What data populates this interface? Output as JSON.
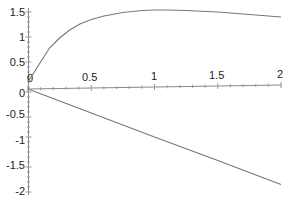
{
  "chart_data": [
    {
      "type": "line",
      "title": "",
      "xlabel": "",
      "ylabel": "",
      "xlim": [
        0,
        2
      ],
      "ylim": [
        0,
        1.6
      ],
      "grid": false,
      "legend": null,
      "x_ticks": [
        "0",
        "0.5",
        "1",
        "1.5",
        "2"
      ],
      "y_ticks": [
        "0.5",
        "1",
        "1.5"
      ],
      "series": [
        {
          "name": "upper curve",
          "color": "#777777",
          "x": [
            0,
            0.02,
            0.1,
            0.17,
            0.25,
            0.33,
            0.41,
            0.5,
            0.6,
            0.75,
            0.9,
            1.0,
            1.1,
            1.25,
            1.5,
            1.75,
            2.0
          ],
          "y": [
            0.1,
            0.18,
            0.5,
            0.78,
            0.98,
            1.14,
            1.26,
            1.35,
            1.42,
            1.49,
            1.53,
            1.54,
            1.54,
            1.53,
            1.5,
            1.45,
            1.4
          ]
        }
      ]
    },
    {
      "type": "line",
      "title": "",
      "xlabel": "",
      "ylabel": "",
      "xlim": [
        0,
        2
      ],
      "ylim": [
        -2,
        0
      ],
      "grid": false,
      "legend": null,
      "y_ticks": [
        "0",
        "-0.5",
        "-1",
        "-1.5",
        "-2"
      ],
      "series": [
        {
          "name": "lower line",
          "color": "#777777",
          "x": [
            0,
            0.5,
            1.0,
            1.5,
            2.0
          ],
          "y": [
            0,
            -0.49,
            -0.98,
            -1.46,
            -1.95
          ]
        }
      ]
    }
  ],
  "axes": {
    "x_tick_labels": [
      "0",
      "0.5",
      "1",
      "1.5",
      "2"
    ],
    "upper_y_tick_labels": [
      "1.5",
      "1",
      "0.5"
    ],
    "lower_y_tick_labels": [
      "0",
      "-0.5",
      "-1",
      "-1.5",
      "-2"
    ]
  }
}
